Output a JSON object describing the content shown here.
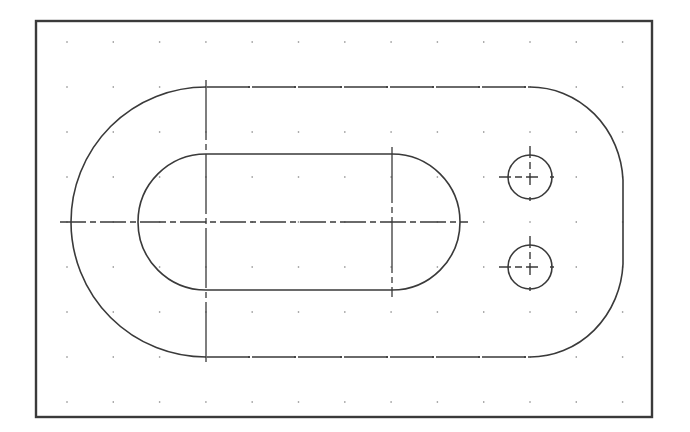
{
  "drawing": {
    "type": "cad-slotted-plate",
    "colors": {
      "background": "#ffffff",
      "line": "#3a3a3a",
      "frame": "#3a3a3a",
      "grid": "#8a8a8a"
    },
    "frame": {
      "x": 36,
      "y": 21,
      "width": 616,
      "height": 396
    },
    "grid": {
      "x_start": 67,
      "y_start": 42,
      "spacing_x": 46.3,
      "spacing_y": 45,
      "cols": 13,
      "rows": 9
    },
    "outer_slot": {
      "left_center": [
        206,
        222
      ],
      "right_center": [
        530,
        222
      ],
      "radius": 135,
      "right_flat_x": 623
    },
    "inner_slot": {
      "left_center": [
        206,
        222
      ],
      "right_center": [
        392,
        222
      ],
      "radius": 68
    },
    "holes": [
      {
        "center": [
          530,
          177
        ],
        "radius": 22
      },
      {
        "center": [
          530,
          267
        ],
        "radius": 22
      }
    ],
    "centerlines": {
      "horizontal": {
        "y": 222,
        "x1": 60,
        "x2": 468
      },
      "vertical_left": {
        "x": 206,
        "y1": 80,
        "y2": 365
      },
      "vertical_right": {
        "x": 392,
        "y1": 147,
        "y2": 297
      }
    }
  }
}
